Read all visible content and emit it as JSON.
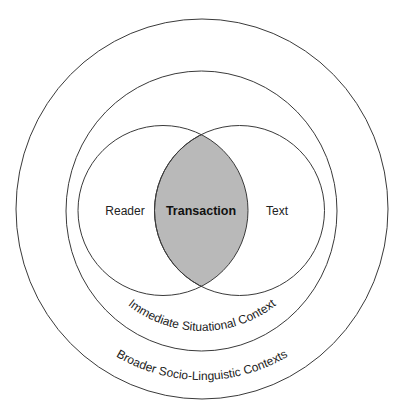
{
  "diagram": {
    "type": "nested-venn",
    "labels": {
      "reader": "Reader",
      "transaction": "Transaction",
      "text": "Text",
      "immediate_context": "Immediate Situational Context",
      "broader_context": "Broader Socio-Linguistic Contexts"
    },
    "colors": {
      "stroke": "#3a3a3a",
      "overlap_fill": "#b9b9b9",
      "background": "#ffffff"
    }
  }
}
